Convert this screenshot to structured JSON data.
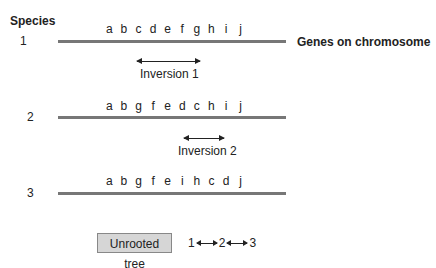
{
  "header": {
    "species_label": "Species"
  },
  "legend": {
    "chromosome_label": "Genes on chromosome"
  },
  "species": [
    {
      "number": "1",
      "genes": [
        "a",
        "b",
        "c",
        "d",
        "e",
        "f",
        "g",
        "h",
        "i",
        "j"
      ]
    },
    {
      "number": "2",
      "genes": [
        "a",
        "b",
        "g",
        "f",
        "e",
        "d",
        "c",
        "h",
        "i",
        "j"
      ]
    },
    {
      "number": "3",
      "genes": [
        "a",
        "b",
        "g",
        "f",
        "e",
        "i",
        "h",
        "c",
        "d",
        "j"
      ]
    }
  ],
  "inversions": [
    {
      "label": "Inversion 1"
    },
    {
      "label": "Inversion 2"
    }
  ],
  "tree": {
    "label": "Unrooted tree",
    "nodes": [
      "1",
      "2",
      "3"
    ]
  },
  "colors": {
    "chromosome": "#777777",
    "box": "#d6d6d6",
    "text": "#222222"
  }
}
